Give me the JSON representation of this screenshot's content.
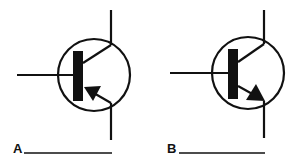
{
  "diagram": {
    "title": "",
    "symbols": [
      {
        "id": "A",
        "label": "A",
        "type": "PNP transistor",
        "answer_blank": "__________"
      },
      {
        "id": "B",
        "label": "B",
        "type": "NPN transistor",
        "answer_blank": "__________"
      }
    ],
    "colors": {
      "stroke": "#111111",
      "background": "#ffffff"
    }
  }
}
